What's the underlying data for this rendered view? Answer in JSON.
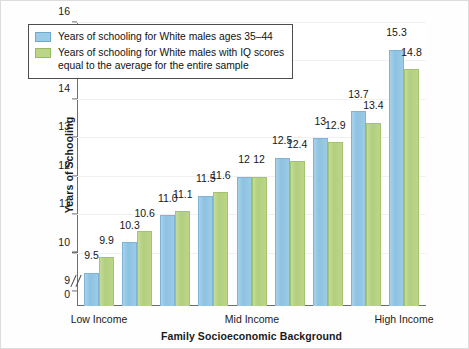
{
  "chart_data": {
    "type": "bar",
    "title": "",
    "xlabel": "Family Socioeconomic Background",
    "ylabel": "Years of Schooling",
    "ylim": [
      9,
      16
    ],
    "yticks": [
      9,
      10,
      11,
      12,
      13,
      14,
      15,
      16
    ],
    "ytick_labels": [
      "9",
      "10",
      "11",
      "12",
      "13",
      "14",
      "15",
      "16"
    ],
    "y_zero_label": "0",
    "axis_break": true,
    "grid": true,
    "legend_position": "upper-left-inside",
    "categories": [
      "1",
      "2",
      "3",
      "4",
      "5",
      "6",
      "7",
      "8",
      "9"
    ],
    "category_axis_labels": [
      {
        "text": "Low Income",
        "at_group": 1
      },
      {
        "text": "Mid Income",
        "at_group": 5
      },
      {
        "text": "High Income",
        "at_group": 9
      }
    ],
    "series": [
      {
        "name": "Years of schooling for White males ages 35–44",
        "color": "#9bcbe6",
        "values": [
          9.5,
          10.3,
          11.0,
          11.5,
          12,
          12.5,
          13,
          13.7,
          15.3
        ],
        "labels": [
          "9.5",
          "10.3",
          "11.0",
          "11.5",
          "12",
          "12.5",
          "13",
          "13.7",
          "15.3"
        ]
      },
      {
        "name": "Years of schooling for White males with IQ scores equal to the average for the entire sample",
        "color": "#bad686",
        "values": [
          9.9,
          10.6,
          11.1,
          11.6,
          12,
          12.4,
          12.9,
          13.4,
          14.8
        ],
        "labels": [
          "9.9",
          "10.6",
          "11.1",
          "11.6",
          "12",
          "12.4",
          "12.9",
          "13.4",
          "14.8"
        ]
      }
    ]
  },
  "legend": {
    "entries": [
      {
        "swatch": "blue",
        "line1": "Years of schooling for White males ages 35–44",
        "line2": ""
      },
      {
        "swatch": "green",
        "line1": "Years of schooling for White males with IQ scores",
        "line2": "equal to the average for the entire sample"
      }
    ]
  },
  "colors": {
    "series_blue": "#9bcbe6",
    "series_green": "#bad686",
    "axis": "#6e6e6e",
    "text": "#1a1a1a",
    "grid": "#f0f0f0"
  }
}
